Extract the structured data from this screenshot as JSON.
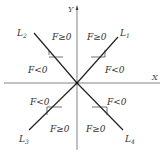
{
  "axes": {
    "x_label": "X",
    "y_label": "Y"
  },
  "lines": [
    {
      "name": "L",
      "sub": "1"
    },
    {
      "name": "L",
      "sub": "2"
    },
    {
      "name": "L",
      "sub": "3"
    },
    {
      "name": "L",
      "sub": "4"
    }
  ],
  "regions": {
    "upper_left_inner": "F≥0",
    "upper_right_inner": "F≥0",
    "left_upper": "F<0",
    "right_upper": "F<0",
    "left_lower": "F<0",
    "right_lower": "F<0",
    "lower_left_inner": "F≥0",
    "lower_right_inner": "F≥0"
  },
  "colors": {
    "line": "#222222",
    "axis": "#555555",
    "text": "#333333"
  }
}
